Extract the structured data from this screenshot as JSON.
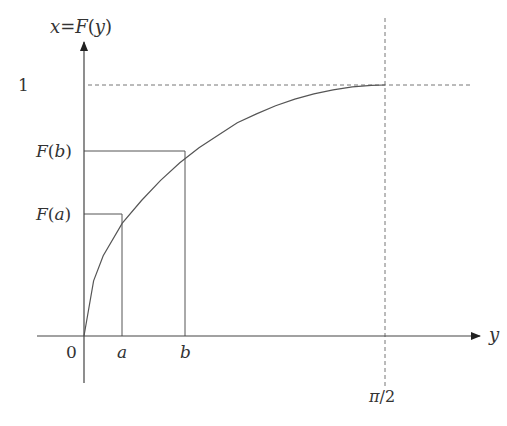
{
  "diagram": {
    "colors": {
      "line": "#555555",
      "dashed": "#777777",
      "text": "#333333",
      "background": "#ffffff"
    },
    "axes": {
      "vertical_label": "x=F(y)",
      "horizontal_label": "y",
      "origin_label": "0"
    },
    "x_ticks": [
      {
        "label": "a"
      },
      {
        "label": "b"
      },
      {
        "label": "π/2"
      }
    ],
    "y_ticks": [
      {
        "label": "1"
      },
      {
        "label": "F(b)"
      },
      {
        "label": "F(a)"
      }
    ],
    "curve": {
      "description": "Increasing concave curve from origin rising steeply then flattening to reach 1 at y = π/2",
      "samples": [
        [
          0,
          0
        ],
        [
          0.05,
          0.22
        ],
        [
          0.1,
          0.32
        ],
        [
          0.2,
          0.45
        ],
        [
          0.3,
          0.54
        ],
        [
          0.4,
          0.62
        ],
        [
          0.5,
          0.69
        ],
        [
          0.6,
          0.75
        ],
        [
          0.7,
          0.8
        ],
        [
          0.8,
          0.85
        ],
        [
          0.9,
          0.885
        ],
        [
          1.0,
          0.917
        ],
        [
          1.1,
          0.944
        ],
        [
          1.2,
          0.965
        ],
        [
          1.3,
          0.981
        ],
        [
          1.4,
          0.993
        ],
        [
          1.5,
          0.999
        ],
        [
          1.5708,
          1.0
        ]
      ]
    },
    "guides": {
      "horizontal_dashed": "x = 1",
      "vertical_dashed": "y = π/2",
      "solid_projections": [
        "a → F(a)",
        "b → F(b)"
      ]
    }
  }
}
